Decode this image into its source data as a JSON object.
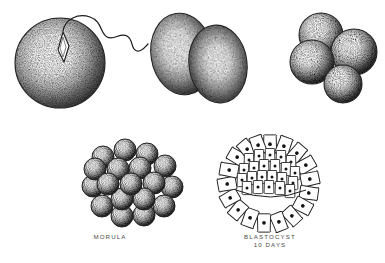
{
  "illustration": {
    "title": "Human Embryonic Development Stages",
    "style": "pen-and-ink stipple engraving",
    "background_color": "#ffffff",
    "ink_color": "#1a1a1a",
    "caption_color": "#4a4a4a"
  },
  "stages": [
    {
      "id": "fertilized-ovum",
      "name": "fertilized-ovum-with-sperm",
      "description": "Spherical ovum with sperm head penetrating and wavy flagellum trailing",
      "caption": "",
      "cell_count": 1
    },
    {
      "id": "two-cell",
      "name": "two-cell-stage",
      "description": "Two overlapping ovoid blastomeres after first cleavage",
      "caption": "",
      "cell_count": 2
    },
    {
      "id": "four-cell",
      "name": "four-cell-stage",
      "description": "Four rounded blastomeres clustered together",
      "caption": "",
      "cell_count": 4
    },
    {
      "id": "morula",
      "name": "morula-stage",
      "description": "Mulberry-like solid ball of many blastomeres",
      "caption": "MORULA",
      "cell_count": 16
    },
    {
      "id": "blastocyst",
      "name": "blastocyst-stage",
      "description": "Cross-section outline: ring of nucleated trophoblast cells, inner cell mass above, blastocoel cavity below",
      "caption_line1": "BLASTOCYST",
      "caption_line2": "10 DAYS",
      "age": "10 DAYS"
    }
  ]
}
